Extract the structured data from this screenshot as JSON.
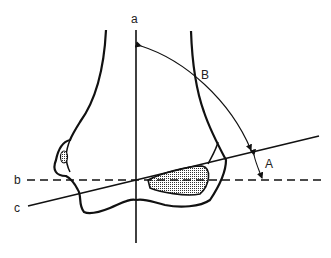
{
  "diagram": {
    "labels": {
      "axis_a": "a",
      "line_b": "b",
      "line_c": "c",
      "angle_A": "A",
      "angle_B": "B"
    },
    "colors": {
      "stroke": "#111111",
      "fill_shaded": "#c8c8c8",
      "background": "#ffffff"
    }
  }
}
